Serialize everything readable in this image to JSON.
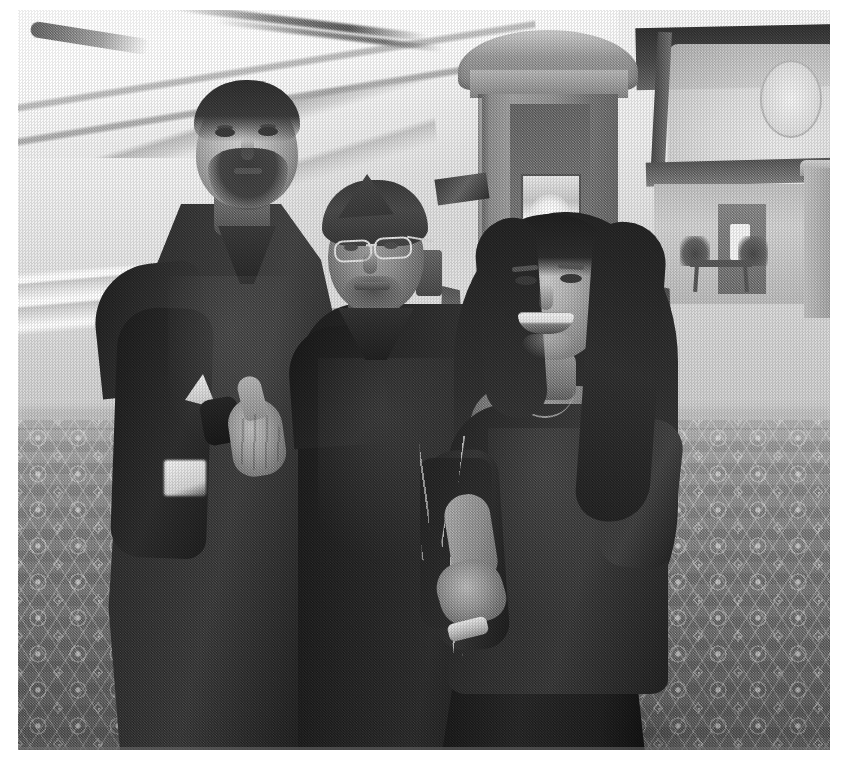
{
  "document": {
    "kind": "scanned-photograph",
    "orientation": "landscape",
    "rendering": "black-and-white halftone photocopy",
    "page_background": "#ffffff",
    "photo_background": "#b4b4b4"
  },
  "photo": {
    "title": "Three people posing in a hotel lobby",
    "scene": "Indoor hotel / casino lobby corridor with patterned carpet",
    "color_mode": "grayscale",
    "palette": {
      "paper_white": "#ffffff",
      "highlight": "#f2f2f2",
      "midtone": "#9a9a9a",
      "shadow": "#3a3a3a",
      "deep_shadow": "#1e1e1e"
    }
  },
  "subjects": [
    {
      "id": "left-man",
      "label": "Tall man with dark beard",
      "position": "left",
      "clothing": "Black long-sleeve shirt, dark trousers",
      "gesture": "Thumbs up with right hand",
      "expression": "Neutral, looking at camera"
    },
    {
      "id": "middle-man",
      "label": "Man wearing garrison cap and eyeglasses",
      "position": "center",
      "clothing": "Dark shirt",
      "gesture": "Arm around the woman",
      "expression": "Smiling"
    },
    {
      "id": "right-woman",
      "label": "Woman with long dark hair",
      "position": "right",
      "clothing": "Dark top and dark skirt, chain-strap handbag, wristwatch",
      "gesture": "Leaning in, hand resting forward",
      "expression": "Broad smile"
    }
  ],
  "background_elements": [
    {
      "id": "ceiling",
      "label": "Bright coffered ceiling with soffit bands"
    },
    {
      "id": "ceiling-light",
      "label": "Recessed downlight"
    },
    {
      "id": "left-railing",
      "label": "Horizontal railing along left wall"
    },
    {
      "id": "central-column",
      "label": "Ornate square pillar with capital"
    },
    {
      "id": "framed-poster",
      "label": "Illuminated framed poster on pillar"
    },
    {
      "id": "trash-bin",
      "label": "Lobby waste receptacle"
    },
    {
      "id": "banquet-chairs",
      "label": "Row of banquet chairs"
    },
    {
      "id": "entry-archway",
      "label": "Archway / entrance at far right"
    },
    {
      "id": "console-table",
      "label": "Console table with two plants"
    },
    {
      "id": "carpet",
      "label": "Ornate arabesque patterned carpet"
    }
  ]
}
